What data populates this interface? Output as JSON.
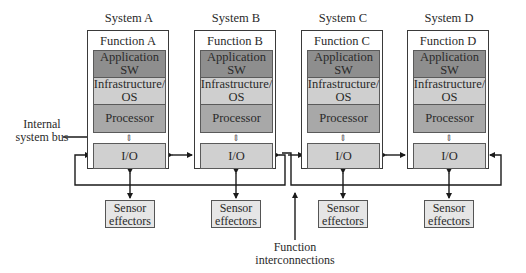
{
  "diagram": {
    "systems": [
      {
        "title": "System A",
        "function": "Function A",
        "left": 87,
        "layers": {
          "app": "Application SW",
          "infra": "Infrastructure/ OS",
          "processor": "Processor",
          "io": "I/O"
        },
        "sensor": "Sensor effectors"
      },
      {
        "title": "System B",
        "function": "Function B",
        "left": 194,
        "layers": {
          "app": "Application SW",
          "infra": "Infrastructure/ OS",
          "processor": "Processor",
          "io": "I/O"
        },
        "sensor": "Sensor effectors"
      },
      {
        "title": "System C",
        "function": "Function C",
        "left": 301,
        "layers": {
          "app": "Application SW",
          "infra": "Infrastructure/ OS",
          "processor": "Processor",
          "io": "I/O"
        },
        "sensor": "Sensor effectors"
      },
      {
        "title": "System D",
        "function": "Function D",
        "left": 407,
        "layers": {
          "app": "Application SW",
          "infra": "Infrastructure/ OS",
          "processor": "Processor",
          "io": "I/O"
        },
        "sensor": "Sensor effectors"
      }
    ],
    "annotations": {
      "internal_bus": "Internal system bus",
      "interconnections": "Function interconnections"
    },
    "colors": {
      "app_sw": "#8e8e8e",
      "infrastructure": "#cfcfcf",
      "processor": "#a8a8a8",
      "io": "#d0d0d0",
      "sensor": "#e6e6e6",
      "lines": "#1a1a1a"
    }
  }
}
